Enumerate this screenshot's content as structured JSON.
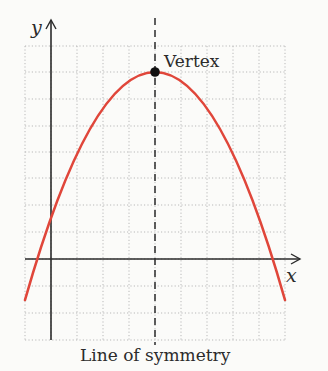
{
  "diagram": {
    "axes": {
      "x_label": "x",
      "y_label": "y"
    },
    "annotations": {
      "vertex_label": "Vertex",
      "symmetry_label": "Line of symmetry"
    },
    "grid": {
      "columns": 10,
      "rows": 11,
      "style": "dotted",
      "color": "#b9b9b9"
    },
    "colors": {
      "curve": "#e0463a",
      "axes": "#2b2b2b",
      "symmetry_line": "#2b2b2b",
      "vertex_point": "#111111",
      "background": "#fbfbf9"
    },
    "geometry": {
      "origin_grid_units": {
        "col": 1,
        "row": 8
      },
      "vertex_grid_units": {
        "x": 4,
        "y": 7
      },
      "curve_x_range": [
        -1,
        9
      ],
      "parabola_equation": "y = -0.5625 (x - 4)^2 + 7",
      "x_intercepts_approx": [
        -0.5,
        8.5
      ]
    }
  }
}
